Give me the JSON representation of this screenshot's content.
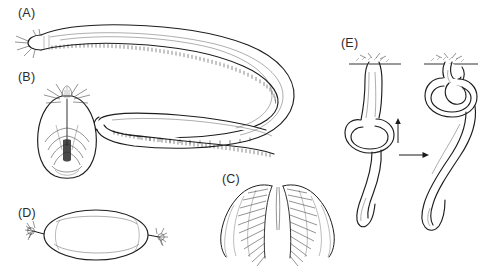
{
  "figure": {
    "kind": "scientific-illustration-plate",
    "background_color": "#ffffff",
    "ink_color": "#1b1b1b",
    "label_color": "#2b2b2b",
    "width": 498,
    "height": 277
  },
  "panels": [
    {
      "id": "A",
      "label": "(A)",
      "label_x": 18,
      "label_y": 6,
      "content": "whole-body-lateral-view",
      "description": "Elongate eel-like hagfish body in lateral view, curving in a broad U-turn; head with barbels at upper left, rounded tail tip at mid-left; dense slime-pore fringe along the ventral margin."
    },
    {
      "id": "B",
      "label": "(B)",
      "label_x": 18,
      "label_y": 70,
      "content": "head-ventral-view",
      "description": "Ventral view of the head showing paired barbels around the nasal opening and the branching dental musculature of the mouth."
    },
    {
      "id": "C",
      "label": "(C)",
      "label_x": 222,
      "label_y": 172,
      "content": "dental-plate",
      "description": "Paired fan-shaped keratinous tooth rows of the rasping dental plate, arranged bilaterally."
    },
    {
      "id": "D",
      "label": "(D)",
      "label_x": 18,
      "label_y": 206,
      "content": "egg-capsule",
      "description": "Elongate oval egg capsule bearing a stalked tuft of anchor filaments at each pole."
    },
    {
      "id": "E",
      "label": "(E)",
      "label_x": 341,
      "label_y": 36,
      "content": "knotting-behaviour-sequence",
      "description": "Two-stage sequence of knotting behaviour: the body passes a loop along its length to scrape slime or gain leverage; arrows indicate direction of loop travel and sequence order."
    }
  ],
  "annotations": {
    "loop_direction_arrow": "up-arrow",
    "sequence_arrow": "right-arrow"
  }
}
